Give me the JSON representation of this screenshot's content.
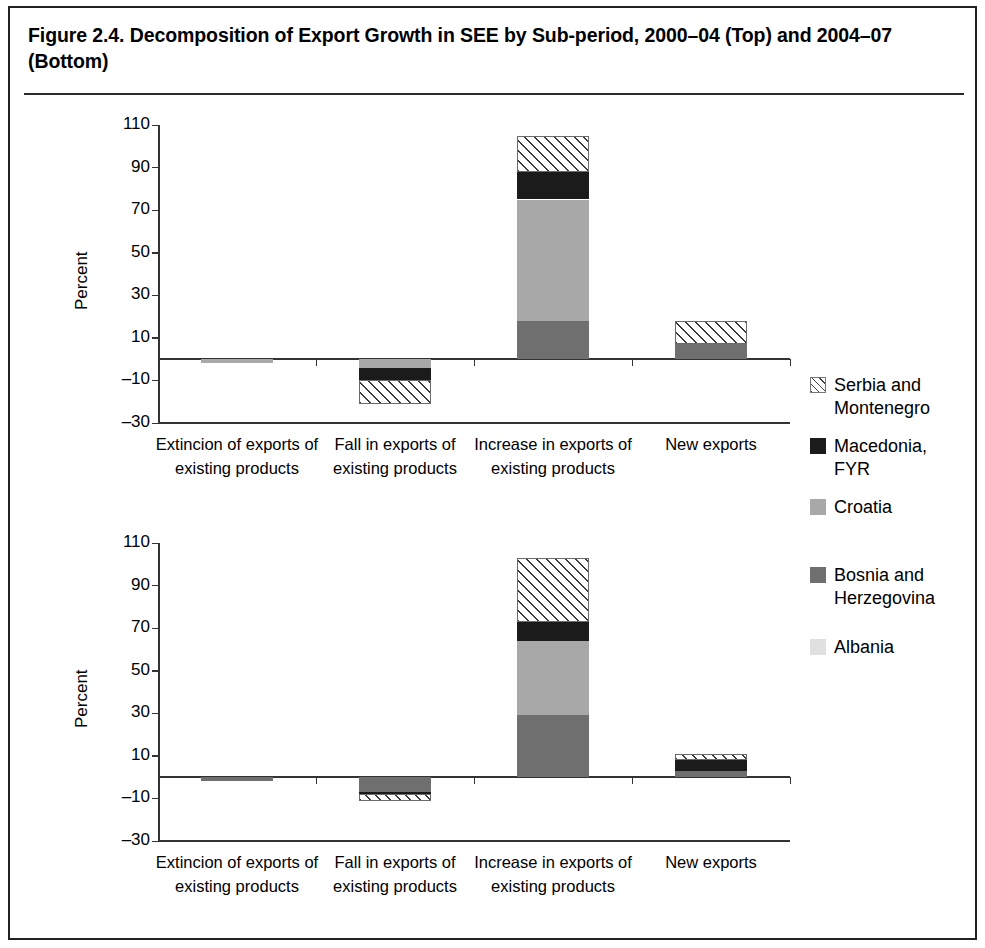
{
  "figure": {
    "title": "Figure 2.4. Decomposition of Export Growth in SEE by Sub-period, 2000–04 (Top) and 2004–07 (Bottom)"
  },
  "legend": {
    "position": "right",
    "items": [
      {
        "label": "Serbia and\nMontenegro",
        "key": "serbia",
        "pattern": "diagonal-hatch",
        "color": "#ffffff"
      },
      {
        "label": "Macedonia,\nFYR",
        "key": "macedonia",
        "pattern": "solid",
        "color": "#1b1b1b"
      },
      {
        "label": "Croatia",
        "key": "croatia",
        "pattern": "solid",
        "color": "#a8a8a8"
      },
      {
        "label": "Bosnia and\nHerzegovina",
        "key": "bosnia",
        "pattern": "solid",
        "color": "#6f6f6f"
      },
      {
        "label": "Albania",
        "key": "albania",
        "pattern": "solid",
        "color": "#e0e0e0"
      }
    ]
  },
  "chart_data": [
    {
      "id": "top",
      "type": "bar",
      "stacked": true,
      "subtitle": "2000–04 (Top)",
      "title": "",
      "xlabel": "",
      "ylabel": "Percent",
      "ylim": [
        -30,
        110
      ],
      "yticks": [
        110,
        90,
        70,
        50,
        30,
        10,
        -10,
        -30
      ],
      "ytick_labels": [
        "110",
        "90",
        "70",
        "50",
        "30",
        "10",
        "–10",
        "–30"
      ],
      "grid": false,
      "categories": [
        "Extincion of exports of existing products",
        "Fall in exports of existing products",
        "Increase in exports of existing products",
        "New exports"
      ],
      "series": [
        {
          "name": "Albania",
          "key": "albania",
          "values": [
            0,
            0,
            0,
            0
          ]
        },
        {
          "name": "Bosnia and Herzegovina",
          "key": "bosnia",
          "values": [
            0,
            0,
            18,
            7
          ]
        },
        {
          "name": "Croatia",
          "key": "croatia",
          "values": [
            -2,
            -4,
            57,
            0
          ]
        },
        {
          "name": "Macedonia, FYR",
          "key": "macedonia",
          "values": [
            0,
            -6,
            13,
            0
          ]
        },
        {
          "name": "Serbia and Montenegro",
          "key": "serbia",
          "values": [
            0,
            -11,
            17,
            11
          ]
        }
      ],
      "totals": [
        -2,
        -21,
        105,
        18
      ]
    },
    {
      "id": "bottom",
      "type": "bar",
      "stacked": true,
      "subtitle": "2004–07 (Bottom)",
      "title": "",
      "xlabel": "",
      "ylabel": "Percent",
      "ylim": [
        -30,
        110
      ],
      "yticks": [
        110,
        90,
        70,
        50,
        30,
        10,
        -10,
        -30
      ],
      "ytick_labels": [
        "110",
        "90",
        "70",
        "50",
        "30",
        "10",
        "–10",
        "–30"
      ],
      "grid": false,
      "categories": [
        "Extincion of exports of existing products",
        "Fall in exports of existing products",
        "Increase in exports of existing products",
        "New exports"
      ],
      "series": [
        {
          "name": "Albania",
          "key": "albania",
          "values": [
            0,
            0,
            0,
            0
          ]
        },
        {
          "name": "Bosnia and Herzegovina",
          "key": "bosnia",
          "values": [
            -2,
            -7,
            29,
            3
          ]
        },
        {
          "name": "Croatia",
          "key": "croatia",
          "values": [
            0,
            0,
            35,
            0
          ]
        },
        {
          "name": "Macedonia, FYR",
          "key": "macedonia",
          "values": [
            0,
            -1,
            9,
            5
          ]
        },
        {
          "name": "Serbia and Montenegro",
          "key": "serbia",
          "values": [
            0,
            -3,
            30,
            3
          ]
        }
      ],
      "totals": [
        -2,
        -11,
        103,
        11
      ]
    }
  ]
}
